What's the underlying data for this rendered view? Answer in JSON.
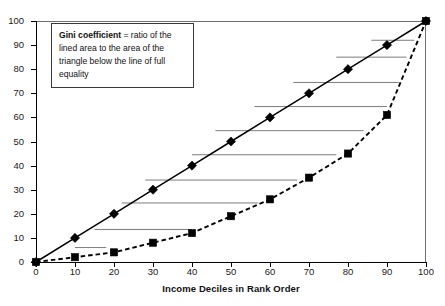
{
  "chart_data": {
    "type": "line",
    "title": "",
    "subtitle": "",
    "xlabel": "Income Deciles in Rank Order",
    "ylabel": "",
    "xlim": [
      0,
      100
    ],
    "ylim": [
      0,
      100
    ],
    "grid": false,
    "legend_position": "none",
    "x": [
      0,
      10,
      20,
      30,
      40,
      50,
      60,
      70,
      80,
      90,
      100
    ],
    "xticks": [
      "0",
      "10",
      "20",
      "30",
      "40",
      "50",
      "60",
      "70",
      "80",
      "90",
      "100"
    ],
    "yticks": [
      "0",
      "10",
      "20",
      "30",
      "40",
      "50",
      "60",
      "70",
      "80",
      "90",
      "100"
    ],
    "series": [
      {
        "name": "line of full equality",
        "marker": "diamond",
        "linestyle": "solid",
        "color": "#000000",
        "values": [
          0,
          10,
          20,
          30,
          40,
          50,
          60,
          70,
          80,
          90,
          100
        ]
      },
      {
        "name": "Lorenz curve",
        "marker": "square",
        "linestyle": "dashed",
        "color": "#000000",
        "values": [
          0,
          2,
          4,
          8,
          12,
          19,
          26,
          35,
          45,
          61,
          100
        ]
      }
    ],
    "annotations": [
      {
        "name": "gini-definition",
        "bold_lead": "Gini coefficient",
        "body": " = ratio of the lined area to the area of the triangle below the line of full equality"
      }
    ],
    "hatch_lines": [
      {
        "x_from": 10,
        "x_to": 18,
        "y": 6
      },
      {
        "x_from": 15,
        "x_to": 40,
        "y": 13.5
      },
      {
        "x_from": 22,
        "x_to": 57,
        "y": 24.5
      },
      {
        "x_from": 28,
        "x_to": 67,
        "y": 34
      },
      {
        "x_from": 40,
        "x_to": 77,
        "y": 44.5
      },
      {
        "x_from": 46,
        "x_to": 84,
        "y": 54.5
      },
      {
        "x_from": 56,
        "x_to": 90,
        "y": 64.5
      },
      {
        "x_from": 66,
        "x_to": 93,
        "y": 74.5
      },
      {
        "x_from": 77,
        "x_to": 95,
        "y": 85
      },
      {
        "x_from": 86,
        "x_to": 97,
        "y": 92
      }
    ]
  },
  "annotation": {
    "bold_lead": "Gini coefficient",
    "rest": " = ratio of the lined area to the area of the triangle below the line of full equality"
  },
  "axis": {
    "x_title": "Income Deciles in Rank Order"
  },
  "colors": {
    "line": "#000000",
    "hatch": "#7d7d7d",
    "frame": "#6e6e6e",
    "text": "#1a1a1a",
    "background": "#ffffff"
  }
}
